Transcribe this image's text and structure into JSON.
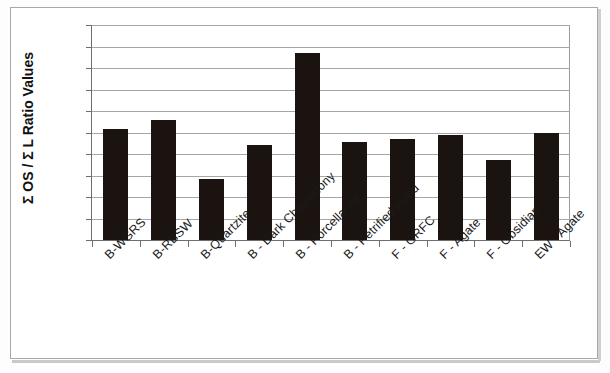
{
  "chart_data": {
    "type": "bar",
    "title": "",
    "xlabel": "",
    "ylabel": "Σ OS / Σ L Ratio Values",
    "ylim": [
      0,
      0.05
    ],
    "ytick_labels": [
      "0.05",
      "0.045",
      "0.04",
      "0.035",
      "0.03",
      "0.025",
      "0.02",
      "0.015",
      "0.01",
      "0.005",
      "0"
    ],
    "ytick_values": [
      0.05,
      0.045,
      0.04,
      0.035,
      0.03,
      0.025,
      0.02,
      0.015,
      0.01,
      0.005,
      0
    ],
    "grid": true,
    "legend": false,
    "bar_color": "#1a1310",
    "categories": [
      "B-WGRS",
      "B-RBSW",
      "B-Quartzite",
      "B - Dark Chalcedony",
      "B - Porcellanite",
      "B - Petrified wood",
      "F - GRFC",
      "F - Agate",
      "F - Obsidian",
      "EW - Agate"
    ],
    "values": [
      0.0258,
      0.028,
      0.0142,
      0.022,
      0.0435,
      0.0227,
      0.0236,
      0.0245,
      0.0185,
      0.025
    ]
  }
}
